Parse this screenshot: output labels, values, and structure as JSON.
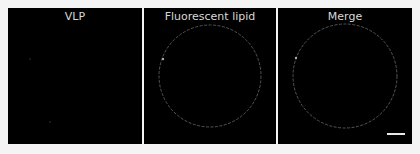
{
  "figure": {
    "panels": [
      {
        "title": "VLP"
      },
      {
        "title": "Fluorescent lipid"
      },
      {
        "title": "Merge"
      }
    ],
    "scale_bar": "present"
  }
}
